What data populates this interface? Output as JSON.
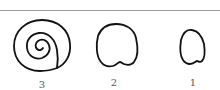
{
  "figure": {
    "stroke_color": "#111111",
    "rule_color": "#9a9a9a",
    "items": [
      {
        "shape": "spiral-shell",
        "label": "3"
      },
      {
        "shape": "rounded-outline-notched",
        "label": "2"
      },
      {
        "shape": "small-rounded-outline-notched",
        "label": "1"
      }
    ]
  }
}
